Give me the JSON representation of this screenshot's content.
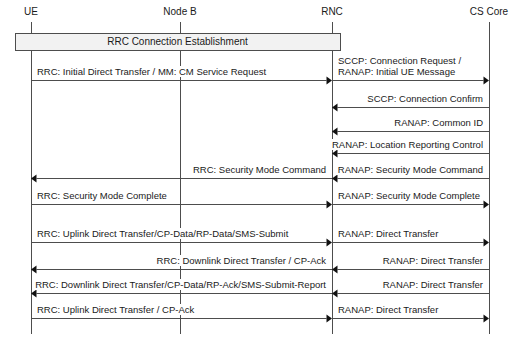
{
  "diagram": {
    "background": "#ffffff",
    "line_color": "#4d4d4d",
    "text_color": "#1a1a1a",
    "box_fill": "#f2f2f2"
  },
  "actors": [
    {
      "id": "ue",
      "label": "UE",
      "x": 31
    },
    {
      "id": "nodeb",
      "label": "Node B",
      "x": 180
    },
    {
      "id": "rnc",
      "label": "RNC",
      "x": 332
    },
    {
      "id": "cscore",
      "label": "CS Core",
      "x": 489
    }
  ],
  "blocks": [
    {
      "label": "RRC Connection Establishment",
      "from": "ue",
      "to": "rnc",
      "x": 15,
      "y": 33,
      "width": 325,
      "height": 17
    }
  ],
  "messages": [
    {
      "label": "RRC: Initial Direct Transfer / MM: CM Service Request",
      "from": "ue",
      "to": "rnc",
      "direction": "right",
      "y": 80,
      "align": "left"
    },
    {
      "label": "SCCP: Connection Request /\nRANAP: Initial UE Message",
      "lines": [
        "SCCP: Connection Request /",
        "RANAP: Initial UE Message"
      ],
      "from": "rnc",
      "to": "cscore",
      "direction": "right",
      "y": 80,
      "align": "left"
    },
    {
      "label": "SCCP: Connection Confirm",
      "from": "cscore",
      "to": "rnc",
      "direction": "left",
      "y": 107,
      "align": "right"
    },
    {
      "label": "RANAP: Common ID",
      "from": "cscore",
      "to": "rnc",
      "direction": "left",
      "y": 131,
      "align": "right"
    },
    {
      "label": "RANAP: Location Reporting Control",
      "from": "cscore",
      "to": "rnc",
      "direction": "left",
      "y": 153,
      "align": "right"
    },
    {
      "label": "RRC: Security Mode Command",
      "from": "rnc",
      "to": "ue",
      "direction": "left",
      "y": 178,
      "align": "right"
    },
    {
      "label": "RANAP: Security Mode Command",
      "from": "cscore",
      "to": "rnc",
      "direction": "left",
      "y": 178,
      "align": "right"
    },
    {
      "label": "RRC: Security Mode Complete",
      "from": "ue",
      "to": "rnc",
      "direction": "right",
      "y": 204,
      "align": "left"
    },
    {
      "label": "RANAP: Security Mode Complete",
      "from": "rnc",
      "to": "cscore",
      "direction": "right",
      "y": 204,
      "align": "left"
    },
    {
      "label": "RRC: Uplink Direct Transfer/CP-Data/RP-Data/SMS-Submit",
      "from": "ue",
      "to": "rnc",
      "direction": "right",
      "y": 242,
      "align": "left"
    },
    {
      "label": "RANAP: Direct Transfer",
      "from": "rnc",
      "to": "cscore",
      "direction": "right",
      "y": 242,
      "align": "left"
    },
    {
      "label": "RRC: Downlink Direct Transfer / CP-Ack",
      "from": "rnc",
      "to": "ue",
      "direction": "left",
      "y": 269,
      "align": "right"
    },
    {
      "label": "RANAP: Direct Transfer",
      "from": "cscore",
      "to": "rnc",
      "direction": "left",
      "y": 269,
      "align": "right"
    },
    {
      "label": "RRC: Downlink Direct Transfer/CP-Data/RP-Ack/SMS-Submit-Report",
      "from": "rnc",
      "to": "ue",
      "direction": "left",
      "y": 293,
      "align": "right"
    },
    {
      "label": "RANAP: Direct Transfer",
      "from": "cscore",
      "to": "rnc",
      "direction": "left",
      "y": 293,
      "align": "right"
    },
    {
      "label": "RRC: Uplink Direct Transfer / CP-Ack",
      "from": "ue",
      "to": "rnc",
      "direction": "right",
      "y": 318,
      "align": "left"
    },
    {
      "label": "RANAP: Direct Transfer",
      "from": "rnc",
      "to": "cscore",
      "direction": "right",
      "y": 318,
      "align": "left"
    }
  ],
  "lifelines": {
    "top": 22,
    "bottom": 334
  }
}
